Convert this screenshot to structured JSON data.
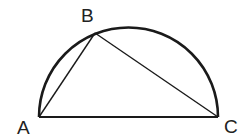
{
  "diagram": {
    "type": "geometry",
    "colors": {
      "stroke": "#1a1a1a",
      "label": "#222222",
      "background": "#ffffff"
    },
    "points": {
      "A": {
        "label": "A",
        "x": 39,
        "y": 117
      },
      "B": {
        "label": "B",
        "x": 95,
        "y": 33
      },
      "C": {
        "label": "C",
        "x": 218,
        "y": 117
      }
    },
    "labels": {
      "A": "A",
      "B": "B",
      "C": "C"
    },
    "semicircle": {
      "center_x": 128.5,
      "center_y": 117,
      "radius": 89.5
    },
    "segments": [
      {
        "from": "A",
        "to": "B"
      },
      {
        "from": "B",
        "to": "C"
      },
      {
        "from": "A",
        "to": "C"
      }
    ]
  }
}
